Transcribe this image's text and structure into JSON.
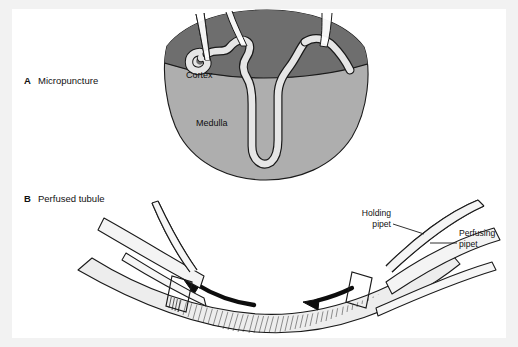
{
  "figure": {
    "background_color": "#f2f2f2",
    "panel_color": "#ffffff",
    "ink_color": "#111111"
  },
  "panels": [
    {
      "letter": "A",
      "title": "Micropuncture",
      "letter_pos": {
        "x": 24,
        "y": 84
      },
      "title_pos": {
        "x": 38,
        "y": 84
      }
    },
    {
      "letter": "B",
      "title": "Perfused tubule",
      "letter_pos": {
        "x": 24,
        "y": 202
      },
      "title_pos": {
        "x": 38,
        "y": 202
      }
    }
  ],
  "kidney": {
    "cortex_label": "Cortex",
    "cortex_label_pos": {
      "x": 186,
      "y": 78
    },
    "cortex_color": "#6e6e6e",
    "medulla_label": "Medulla",
    "medulla_label_pos": {
      "x": 196,
      "y": 126
    },
    "medulla_color": "#aeaeae",
    "tubule_color": "#e6e6e6",
    "outline_color": "#1a1a1a",
    "pipet_count": 3
  },
  "perfusion": {
    "tubule_fill": "#ededed",
    "pipet_fill": "#f4f4f4",
    "hatch_color": "#1a1a1a",
    "arrow_color": "#0d0d0d",
    "arrow_count": 2,
    "labels": [
      {
        "id": "holding-pipet",
        "line1": "Holding",
        "line2": "pipet",
        "anchor": "end",
        "line1_pos": {
          "x": 391,
          "y": 216
        },
        "line2_pos": {
          "x": 391,
          "y": 227
        },
        "leader": {
          "x1": 393,
          "y1": 224,
          "x2": 424,
          "y2": 234
        }
      },
      {
        "id": "perfusing-pipet",
        "line1": "Perfusing",
        "line2": "pipet",
        "anchor": "start",
        "line1_pos": {
          "x": 459,
          "y": 236
        },
        "line2_pos": {
          "x": 459,
          "y": 247
        },
        "leader": {
          "x1": 457,
          "y1": 243,
          "x2": 430,
          "y2": 243
        }
      }
    ]
  }
}
